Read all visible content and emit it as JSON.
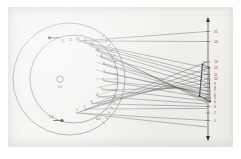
{
  "figure": {
    "name": "optical-ray-diagram",
    "background_color": "#f4f3f0",
    "plate_color": "#f0efec",
    "ink_color": "#4a4a4a",
    "line_color": "#6b6b6b"
  },
  "dial": {
    "center_label": "O",
    "hub_name": "hub-circle",
    "outer_circle": {
      "cx": 69,
      "cy": 79,
      "r": 56
    },
    "inner_circle": {
      "cx": 74,
      "cy": 79,
      "r": 44
    },
    "hub": {
      "cx": 60,
      "cy": 79,
      "r": 3.2
    },
    "hub_caption": "0,0",
    "tick_labels": [
      "15",
      "14",
      "13",
      "12",
      "11",
      "10",
      "9",
      "8",
      "7",
      "6",
      "5",
      "4",
      "3",
      "2",
      "1"
    ],
    "top_marker_label": "A",
    "bottom_marker_label": "B",
    "bottom_left_label": "1,2",
    "bottom_right_label": "0,0"
  },
  "screen": {
    "axis_name": "vertical-image-plane",
    "top_arrow_label": "",
    "bottom_arrow_label": "",
    "x": 208,
    "y_top": 18,
    "y_bottom": 140,
    "tick_labels": [
      "15",
      "14",
      "13",
      "12",
      "11",
      "10",
      "9",
      "8",
      "7",
      "6",
      "5",
      "4",
      "3",
      "2",
      "1"
    ]
  },
  "caustic": {
    "name": "caustic-quadrilateral",
    "labels": [
      "a",
      "b",
      "c",
      "d"
    ]
  },
  "rays": {
    "name": "ray-bundle",
    "count": 15,
    "crossing_point": {
      "x": 150,
      "y": 80
    }
  }
}
